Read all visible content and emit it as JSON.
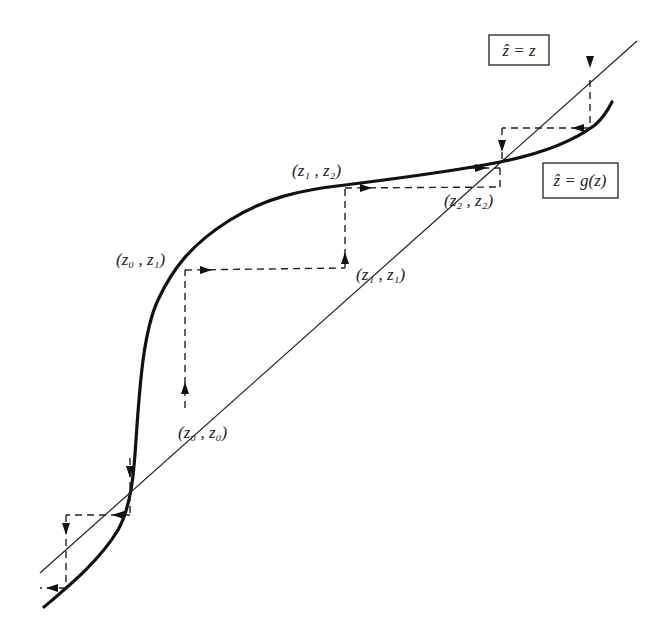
{
  "diagram": {
    "type": "cobweb-iteration",
    "identity_line_label": "ẑ = z",
    "curve_label": "ẑ = g(z)",
    "points": [
      {
        "id": "z0z0",
        "label": "(z₀ , z₀)"
      },
      {
        "id": "z0z1",
        "label": "(z₀ , z₁)"
      },
      {
        "id": "z1z1",
        "label": "(z₁ , z₁)"
      },
      {
        "id": "z1z2",
        "label": "(z₁ , z₂)"
      },
      {
        "id": "z2z2",
        "label": "(z₂ , z₂)"
      }
    ]
  }
}
